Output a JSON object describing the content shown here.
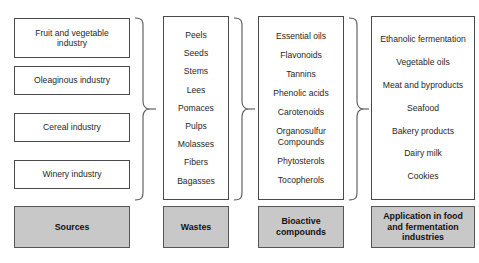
{
  "diagram": {
    "columns": [
      {
        "key": "sources",
        "footer_label": "Sources",
        "kind": "stacked-boxes",
        "items": [
          "Fruit and vegetable\nindustry",
          "Oleaginous industry",
          "Cereal industry",
          "Winery industry"
        ]
      },
      {
        "key": "wastes",
        "footer_label": "Wastes",
        "kind": "single-box-list",
        "items": [
          "Peels",
          "Seeds",
          "Stems",
          "Lees",
          "Pomaces",
          "Pulps",
          "Molasses",
          "Fibers",
          "Bagasses"
        ]
      },
      {
        "key": "bioactive_compounds",
        "footer_label": "Bioactive\ncompounds",
        "kind": "single-box-list",
        "items": [
          "Essential oils",
          "Flavonoids",
          "Tannins",
          "Phenolic acids",
          "Carotenoids",
          "Organosulfur\nCompounds",
          "Phytosterols",
          "Tocopherols"
        ]
      },
      {
        "key": "applications",
        "footer_label": "Application in food\nand fermentation\nindustries",
        "kind": "single-box-list",
        "items": [
          "Ethanolic fermentation",
          "Vegetable oils",
          "Meat and byproducts",
          "Seafood",
          "Bakery products",
          "Dairy milk",
          "Cookies"
        ]
      }
    ],
    "connectors": [
      {
        "key": "sources-to-wastes",
        "type": "curly-brace-arrow"
      },
      {
        "key": "wastes-to-bioactive",
        "type": "curly-brace-arrow"
      },
      {
        "key": "bioactive-to-applications",
        "type": "curly-brace-arrow"
      }
    ],
    "colors": {
      "background": "#ffffff",
      "box_border": "#4a4a4a",
      "footer_fill": "#c8c8c8",
      "footer_border": "#565656",
      "text": "#1f1f1f",
      "connector": "#555555"
    }
  }
}
